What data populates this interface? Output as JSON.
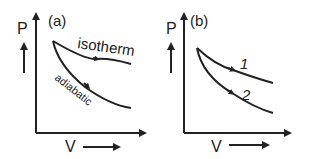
{
  "panels": [
    {
      "id": "a",
      "tag": "(a)",
      "y_axis_label": "P",
      "x_axis_label": "V",
      "curves": [
        {
          "name": "isotherm",
          "label": "isotherm"
        },
        {
          "name": "adiabatic",
          "label": "adiabatic"
        }
      ]
    },
    {
      "id": "b",
      "tag": "(b)",
      "y_axis_label": "P",
      "x_axis_label": "V",
      "curves": [
        {
          "name": "curve-1",
          "label": "1"
        },
        {
          "name": "curve-2",
          "label": "2"
        }
      ]
    }
  ],
  "colors": {
    "ink": "#222222",
    "background": "#ffffff"
  }
}
